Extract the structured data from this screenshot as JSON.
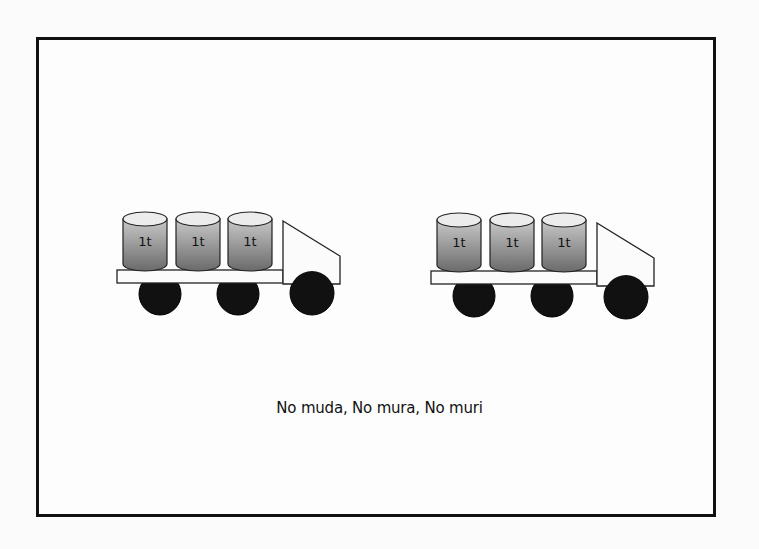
{
  "diagram": {
    "caption": "No muda, No mura, No muri",
    "trucks": [
      {
        "id": "truck-left",
        "loads": [
          {
            "label": "1t",
            "cx": 145
          },
          {
            "label": "1t",
            "cx": 198
          },
          {
            "label": "1t",
            "cx": 250
          }
        ],
        "platform": {
          "x": 117,
          "y": 270,
          "w": 166,
          "h": 13
        },
        "cab": {
          "x": 283,
          "top": 221,
          "right": 340,
          "slant_y": 256,
          "bottom": 284
        },
        "wheels": [
          {
            "cx": 160,
            "cy": 294,
            "r": 21
          },
          {
            "cx": 238,
            "cy": 294,
            "r": 21
          },
          {
            "cx": 312,
            "cy": 293,
            "r": 22
          }
        ]
      },
      {
        "id": "truck-right",
        "loads": [
          {
            "label": "1t",
            "cx": 459
          },
          {
            "label": "1t",
            "cx": 512
          },
          {
            "label": "1t",
            "cx": 564
          }
        ],
        "platform": {
          "x": 431,
          "y": 271,
          "w": 166,
          "h": 13
        },
        "cab": {
          "x": 597,
          "top": 223,
          "right": 654,
          "slant_y": 258,
          "bottom": 286
        },
        "wheels": [
          {
            "cx": 474,
            "cy": 296,
            "r": 21
          },
          {
            "cx": 552,
            "cy": 296,
            "r": 21
          },
          {
            "cx": 626,
            "cy": 297,
            "r": 22
          }
        ]
      }
    ],
    "colors": {
      "border": "#111111",
      "background": "#fdfdfd",
      "drum_top": "#e6e6e6",
      "drum_body_light": "#c4c4c4",
      "drum_body_dark": "#6e6e6e",
      "wheel": "#111111"
    }
  }
}
